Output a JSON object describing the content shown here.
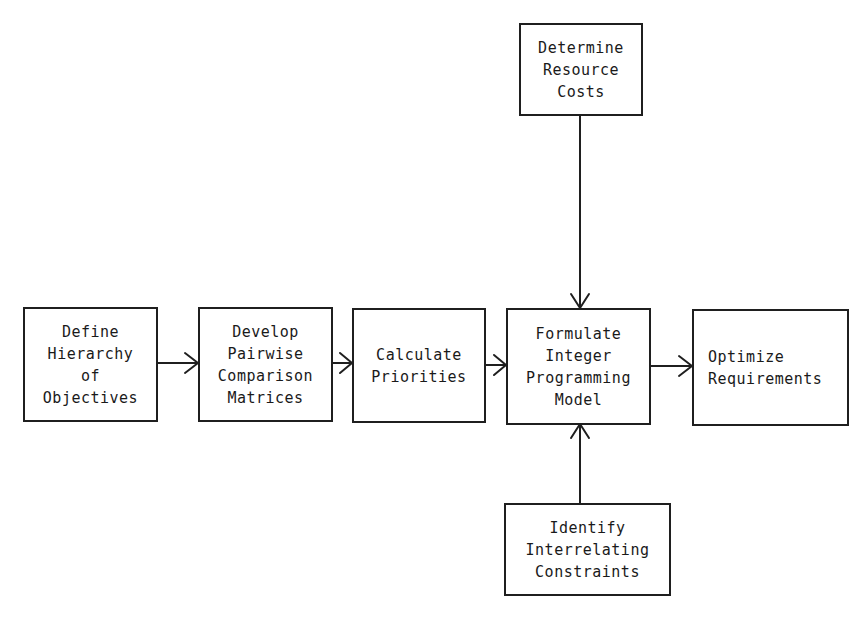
{
  "diagram": {
    "type": "flowchart",
    "nodes": [
      {
        "id": "define-hierarchy",
        "lines": [
          "Define",
          "Hierarchy",
          "of",
          "Objectives"
        ]
      },
      {
        "id": "develop-pairwise",
        "lines": [
          "Develop",
          "Pairwise",
          "Comparison",
          "Matrices"
        ]
      },
      {
        "id": "calculate-priorities",
        "lines": [
          "Calculate",
          "Priorities"
        ]
      },
      {
        "id": "formulate-ip-model",
        "lines": [
          "Formulate",
          "Integer",
          "Programming",
          "Model"
        ]
      },
      {
        "id": "optimize-requirements",
        "lines": [
          "Optimize",
          "Requirements"
        ]
      },
      {
        "id": "determine-resource-costs",
        "lines": [
          "Determine",
          "Resource",
          "Costs"
        ]
      },
      {
        "id": "identify-constraints",
        "lines": [
          "Identify",
          "Interrelating",
          "Constraints"
        ]
      }
    ],
    "edges": [
      {
        "from": "define-hierarchy",
        "to": "develop-pairwise"
      },
      {
        "from": "develop-pairwise",
        "to": "calculate-priorities"
      },
      {
        "from": "calculate-priorities",
        "to": "formulate-ip-model"
      },
      {
        "from": "formulate-ip-model",
        "to": "optimize-requirements"
      },
      {
        "from": "determine-resource-costs",
        "to": "formulate-ip-model"
      },
      {
        "from": "identify-constraints",
        "to": "formulate-ip-model"
      }
    ],
    "colors": {
      "line": "#1f1f1f",
      "background": "#ffffff"
    }
  }
}
